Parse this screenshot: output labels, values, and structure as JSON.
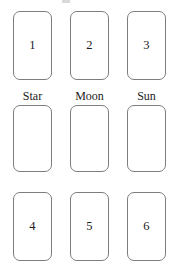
{
  "board": {
    "title": "card-slot-grid",
    "colors": {
      "background": "#ffffff",
      "card_fill": "#ffffff",
      "card_border": "#7d7d7d",
      "text": "#1c1c1c"
    },
    "rows": [
      {
        "row_name": "top-number-row",
        "cards": [
          {
            "label": "1",
            "empty": false
          },
          {
            "label": "2",
            "empty": false
          },
          {
            "label": "3",
            "empty": false
          }
        ]
      },
      {
        "row_name": "labeled-slot-row",
        "slot_labels": [
          "Star",
          "Moon",
          "Sun"
        ],
        "cards": [
          {
            "label": "",
            "empty": true
          },
          {
            "label": "",
            "empty": true
          },
          {
            "label": "",
            "empty": true
          }
        ]
      },
      {
        "row_name": "bottom-number-row",
        "cards": [
          {
            "label": "4",
            "empty": false
          },
          {
            "label": "5",
            "empty": false
          },
          {
            "label": "6",
            "empty": false
          }
        ]
      }
    ]
  }
}
